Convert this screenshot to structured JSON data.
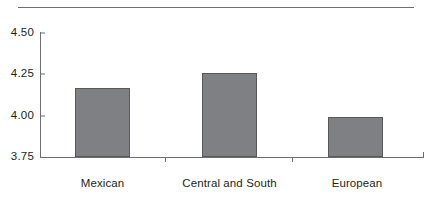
{
  "chart_data": {
    "type": "bar",
    "title": "",
    "subtitle": "",
    "xlabel": "",
    "ylabel": "",
    "categories": [
      "Mexican",
      "Central and South American",
      "European"
    ],
    "values": [
      4.17,
      4.26,
      3.99
    ],
    "ylim": [
      3.75,
      4.5
    ],
    "yticks": [
      "3.75",
      "4.00",
      "4.25",
      "4.50"
    ],
    "ytick_values": [
      3.75,
      4.0,
      4.25,
      4.5
    ],
    "grid": false,
    "legend": null,
    "annotations": [],
    "bar_color": "#7f8083",
    "bar_edge_color": "#58595b",
    "axis_color": "#6d6e71"
  },
  "axis": {
    "y_labels": [
      {
        "text": "4.50",
        "value": 4.5
      },
      {
        "text": "4.25",
        "value": 4.25
      },
      {
        "text": "4.00",
        "value": 4.0
      },
      {
        "text": "3.75",
        "value": 3.75
      }
    ],
    "categories": [
      {
        "line1": "Mexican",
        "line2": ""
      },
      {
        "line1": "Central and South",
        "line2": "American"
      },
      {
        "line1": "European",
        "line2": ""
      }
    ]
  }
}
